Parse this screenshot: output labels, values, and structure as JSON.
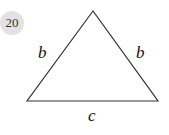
{
  "problem": {
    "number": "20"
  },
  "figure": {
    "shape": "isosceles-triangle",
    "vertices": {
      "apex": [
        93,
        11
      ],
      "bottom_left": [
        27,
        101
      ],
      "bottom_right": [
        158,
        101
      ]
    },
    "labels": {
      "left_side": "b",
      "right_side": "b",
      "base": "c"
    },
    "stroke_color": "#333333"
  }
}
